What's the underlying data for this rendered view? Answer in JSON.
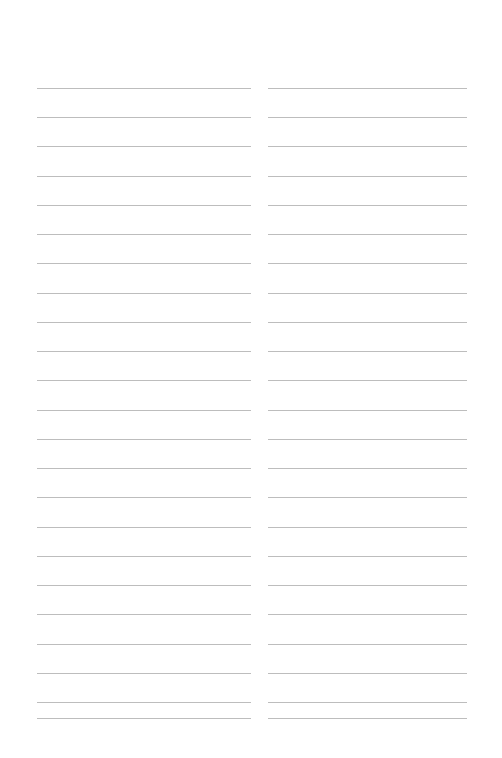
{
  "document": {
    "title": "Blank Lined Note Page",
    "type": "lined-paper",
    "background_color": "#ffffff",
    "rule_color": "#bdbdbd",
    "page_width": 502,
    "page_height": 758,
    "text_content": ""
  },
  "layout": {
    "columns": 2,
    "lines_per_column": 23,
    "first_line_y": 88,
    "line_spacing": 29.2,
    "line_thickness": 1,
    "left_column": {
      "x": 37,
      "width": 214
    },
    "right_column": {
      "x": 268,
      "width": 199
    },
    "column_gap": 17,
    "top_margin": 88,
    "bottom_margin": 40
  },
  "lines": {
    "left": [
      {
        "index": 1,
        "y": 88,
        "text": ""
      },
      {
        "index": 2,
        "y": 117,
        "text": ""
      },
      {
        "index": 3,
        "y": 146,
        "text": ""
      },
      {
        "index": 4,
        "y": 176,
        "text": ""
      },
      {
        "index": 5,
        "y": 205,
        "text": ""
      },
      {
        "index": 6,
        "y": 234,
        "text": ""
      },
      {
        "index": 7,
        "y": 263,
        "text": ""
      },
      {
        "index": 8,
        "y": 293,
        "text": ""
      },
      {
        "index": 9,
        "y": 322,
        "text": ""
      },
      {
        "index": 10,
        "y": 351,
        "text": ""
      },
      {
        "index": 11,
        "y": 380,
        "text": ""
      },
      {
        "index": 12,
        "y": 410,
        "text": ""
      },
      {
        "index": 13,
        "y": 439,
        "text": ""
      },
      {
        "index": 14,
        "y": 468,
        "text": ""
      },
      {
        "index": 15,
        "y": 497,
        "text": ""
      },
      {
        "index": 16,
        "y": 527,
        "text": ""
      },
      {
        "index": 17,
        "y": 556,
        "text": ""
      },
      {
        "index": 18,
        "y": 585,
        "text": ""
      },
      {
        "index": 19,
        "y": 614,
        "text": ""
      },
      {
        "index": 20,
        "y": 644,
        "text": ""
      },
      {
        "index": 21,
        "y": 673,
        "text": ""
      },
      {
        "index": 22,
        "y": 702,
        "text": ""
      },
      {
        "index": 23,
        "y": 718,
        "text": ""
      }
    ],
    "right": [
      {
        "index": 1,
        "y": 88,
        "text": ""
      },
      {
        "index": 2,
        "y": 117,
        "text": ""
      },
      {
        "index": 3,
        "y": 146,
        "text": ""
      },
      {
        "index": 4,
        "y": 176,
        "text": ""
      },
      {
        "index": 5,
        "y": 205,
        "text": ""
      },
      {
        "index": 6,
        "y": 234,
        "text": ""
      },
      {
        "index": 7,
        "y": 263,
        "text": ""
      },
      {
        "index": 8,
        "y": 293,
        "text": ""
      },
      {
        "index": 9,
        "y": 322,
        "text": ""
      },
      {
        "index": 10,
        "y": 351,
        "text": ""
      },
      {
        "index": 11,
        "y": 380,
        "text": ""
      },
      {
        "index": 12,
        "y": 410,
        "text": ""
      },
      {
        "index": 13,
        "y": 439,
        "text": ""
      },
      {
        "index": 14,
        "y": 468,
        "text": ""
      },
      {
        "index": 15,
        "y": 497,
        "text": ""
      },
      {
        "index": 16,
        "y": 527,
        "text": ""
      },
      {
        "index": 17,
        "y": 556,
        "text": ""
      },
      {
        "index": 18,
        "y": 585,
        "text": ""
      },
      {
        "index": 19,
        "y": 614,
        "text": ""
      },
      {
        "index": 20,
        "y": 644,
        "text": ""
      },
      {
        "index": 21,
        "y": 673,
        "text": ""
      },
      {
        "index": 22,
        "y": 702,
        "text": ""
      },
      {
        "index": 23,
        "y": 718,
        "text": ""
      }
    ]
  }
}
